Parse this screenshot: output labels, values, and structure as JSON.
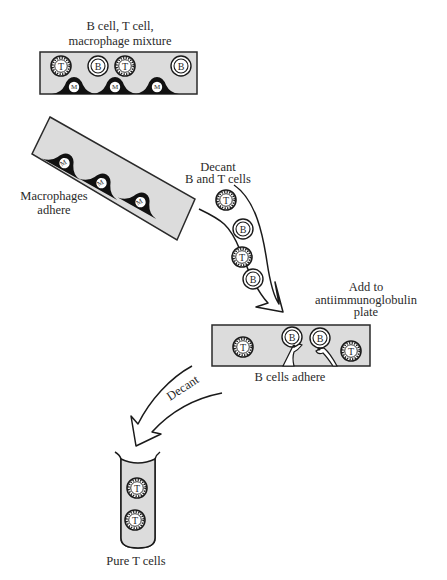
{
  "diagram": {
    "colors": {
      "ink": "#1a1a1a",
      "plate_fill": "#dcdcdc",
      "background": "#ffffff",
      "macrophage_fill": "#111111"
    },
    "step1": {
      "label_line1": "B cell, T cell,",
      "label_line2": "macrophage mixture",
      "cells": [
        {
          "type": "T",
          "label": "T"
        },
        {
          "type": "B",
          "label": "B"
        },
        {
          "type": "T",
          "label": "T"
        },
        {
          "type": "B",
          "label": "B"
        }
      ],
      "macrophages": [
        {
          "label": "M"
        },
        {
          "label": "M"
        },
        {
          "label": "M"
        }
      ]
    },
    "step2": {
      "label_line1": "Macrophages",
      "label_line2": "adhere",
      "macrophages": [
        {
          "label": "M"
        },
        {
          "label": "M"
        },
        {
          "label": "M"
        }
      ]
    },
    "decant1": {
      "label_line1": "Decant",
      "label_line2": "B and T cells",
      "cells": [
        {
          "type": "T",
          "label": "T"
        },
        {
          "type": "B",
          "label": "B"
        },
        {
          "type": "T",
          "label": "T"
        },
        {
          "type": "B",
          "label": "B"
        }
      ]
    },
    "step3": {
      "label_line1": "Add to",
      "label_line2": "antiimmunoglobulin",
      "label_line3": "plate",
      "cells": [
        {
          "type": "T",
          "label": "T"
        },
        {
          "type": "B",
          "label": "B",
          "adherent": true
        },
        {
          "type": "B",
          "label": "B",
          "adherent": true
        },
        {
          "type": "T",
          "label": "T"
        }
      ],
      "caption": "B cells adhere"
    },
    "decant2": {
      "label": "Decant"
    },
    "step4": {
      "cells": [
        {
          "type": "T",
          "label": "T"
        },
        {
          "type": "T",
          "label": "T"
        }
      ],
      "caption": "Pure T cells"
    }
  }
}
